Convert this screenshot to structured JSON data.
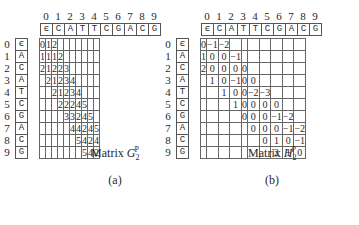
{
  "column_indices": [
    "0",
    "1",
    "2",
    "3",
    "4",
    "5",
    "6",
    "7",
    "8",
    "9"
  ],
  "row_indices": [
    "0",
    "1",
    "2",
    "3",
    "4",
    "5",
    "6",
    "7",
    "8",
    "9"
  ],
  "top_sequence": [
    "ϵ",
    "C",
    "A",
    "T",
    "T",
    "C",
    "G",
    "A",
    "C",
    "G"
  ],
  "side_sequence": [
    "ϵ",
    "A",
    "C",
    "A",
    "T",
    "C",
    "G",
    "A",
    "C",
    "G"
  ],
  "matrix_a": {
    "caption_prefix": "Matrix ",
    "caption_var": "G",
    "caption_sub": "2",
    "caption_sup": "P",
    "label": "(a)",
    "rows": [
      [
        "0",
        "1",
        "2",
        "",
        "",
        "",
        "",
        "",
        "",
        ""
      ],
      [
        "1",
        "1",
        "1",
        "2",
        "",
        "",
        "",
        "",
        "",
        ""
      ],
      [
        "2",
        "1",
        "2",
        "2",
        "3",
        "",
        "",
        "",
        "",
        ""
      ],
      [
        "",
        "2",
        "1",
        "2",
        "3",
        "4",
        "",
        "",
        "",
        ""
      ],
      [
        "",
        "",
        "2",
        "1",
        "2",
        "3",
        "4",
        "",
        "",
        ""
      ],
      [
        "",
        "",
        "",
        "2",
        "2",
        "2",
        "4",
        "5",
        "",
        ""
      ],
      [
        "",
        "",
        "",
        "",
        "3",
        "3",
        "2",
        "4",
        "5",
        ""
      ],
      [
        "",
        "",
        "",
        "",
        "",
        "4",
        "4",
        "2",
        "4",
        "5"
      ],
      [
        "",
        "",
        "",
        "",
        "",
        "",
        "5",
        "4",
        "2",
        "4"
      ],
      [
        "",
        "",
        "",
        "",
        "",
        "",
        "",
        "5",
        "4",
        "2"
      ]
    ]
  },
  "matrix_b": {
    "caption_prefix": "Matrix ",
    "caption_var": "H",
    "caption_sub": "2",
    "caption_sup": "P",
    "label": "(b)",
    "rows": [
      [
        "0",
        "−1",
        "−2",
        "",
        "",
        "",
        "",
        "",
        "",
        ""
      ],
      [
        "1",
        "0",
        "0",
        "−1",
        "",
        "",
        "",
        "",
        "",
        ""
      ],
      [
        "2",
        "0",
        "0",
        "0",
        "0",
        "",
        "",
        "",
        "",
        ""
      ],
      [
        "",
        "1",
        "0",
        "−1",
        "0",
        "0",
        "",
        "",
        "",
        ""
      ],
      [
        "",
        "",
        "1",
        "0",
        "0",
        "−2",
        "−3",
        "",
        "",
        ""
      ],
      [
        "",
        "",
        "",
        "1",
        "0",
        "0",
        "0",
        "0",
        "",
        ""
      ],
      [
        "",
        "",
        "",
        "",
        "0",
        "0",
        "0",
        "−1",
        "−2",
        ""
      ],
      [
        "",
        "",
        "",
        "",
        "",
        "0",
        "0",
        "0",
        "−1",
        "−2"
      ],
      [
        "",
        "",
        "",
        "",
        "",
        "",
        "0",
        "1",
        "0",
        "−1"
      ],
      [
        "",
        "",
        "",
        "",
        "",
        "",
        "",
        "2",
        "1",
        "0"
      ]
    ]
  }
}
